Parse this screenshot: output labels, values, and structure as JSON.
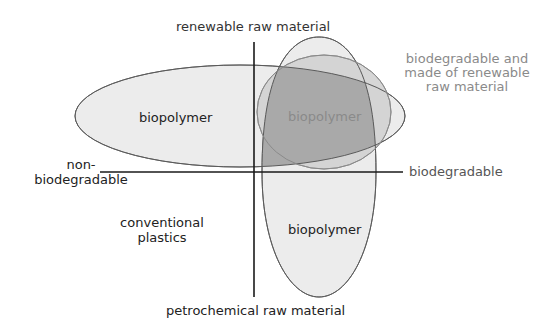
{
  "diagram": {
    "axes": {
      "top_label": "renewable raw material",
      "bottom_label": "petrochemical raw material",
      "left_label_line1": "non-",
      "left_label_line2": "biodegradable",
      "right_label": "biodegradable"
    },
    "regions": {
      "left_ellipse_label": "biopolymer",
      "overlap_label": "biopolymer",
      "bottom_ellipse_label": "biopolymer",
      "conventional_line1": "conventional",
      "conventional_line2": "plastics"
    },
    "callout": {
      "line1": "biodegradable and",
      "line2": "made of renewable",
      "line3": "raw material"
    },
    "colors": {
      "axis": "#1a1a1a",
      "ellipse_fill": "#ececec",
      "ellipse_stroke": "#6e6e6e",
      "overlap_fill": "#a9a9a9",
      "circle_fill": "#c4c4c4",
      "text_dark": "#222222",
      "text_gray": "#8a8a8a"
    }
  }
}
